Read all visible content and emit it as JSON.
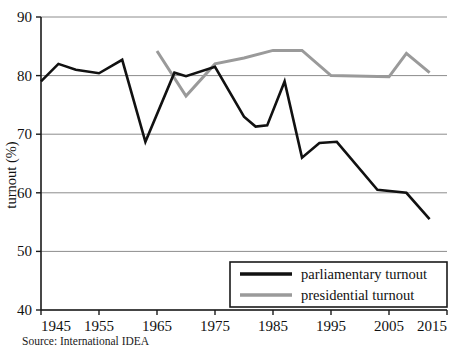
{
  "chart_data": {
    "type": "line",
    "title": "",
    "xlabel": "",
    "ylabel": "turnout (%)",
    "xlim": [
      1945,
      2015
    ],
    "ylim": [
      40,
      90
    ],
    "xticks": [
      1945,
      1955,
      1965,
      1975,
      1985,
      1995,
      2005,
      2015
    ],
    "yticks": [
      40,
      50,
      60,
      70,
      80,
      90
    ],
    "grid": true,
    "legend_position": "bottom-right",
    "source": "Source: International IDEA",
    "series": [
      {
        "name": "parliamentary turnout",
        "color": "#111111",
        "points": [
          [
            1945,
            79.0
          ],
          [
            1948,
            82.0
          ],
          [
            1951,
            81.0
          ],
          [
            1955,
            80.4
          ],
          [
            1959,
            82.7
          ],
          [
            1963,
            68.7
          ],
          [
            1968,
            80.5
          ],
          [
            1970,
            79.9
          ],
          [
            1975,
            81.5
          ],
          [
            1980,
            73.0
          ],
          [
            1982,
            71.3
          ],
          [
            1984,
            71.5
          ],
          [
            1987,
            79.0
          ],
          [
            1990,
            66.0
          ],
          [
            1993,
            68.5
          ],
          [
            1996,
            68.7
          ],
          [
            2003,
            60.5
          ],
          [
            2008,
            60.0
          ],
          [
            2012,
            55.5
          ]
        ]
      },
      {
        "name": "presidential turnout",
        "color": "#9a9a9a",
        "points": [
          [
            1965,
            84.2
          ],
          [
            1970,
            76.5
          ],
          [
            1975,
            82.0
          ],
          [
            1980,
            83.0
          ],
          [
            1985,
            84.3
          ],
          [
            1990,
            84.3
          ],
          [
            1995,
            80.0
          ],
          [
            2005,
            79.8
          ],
          [
            2008,
            83.8
          ],
          [
            2012,
            80.5
          ]
        ]
      }
    ]
  },
  "axis": {
    "y_title": "turnout (%)",
    "y_tick_labels": [
      "90",
      "80",
      "70",
      "60",
      "50",
      "40"
    ],
    "x_tick_labels": [
      "1945",
      "1955",
      "1965",
      "1975",
      "1985",
      "1995",
      "2005",
      "2015"
    ]
  },
  "legend": {
    "items": [
      {
        "label": "parliamentary turnout",
        "color": "#111111"
      },
      {
        "label": "presidential turnout",
        "color": "#9a9a9a"
      }
    ]
  },
  "footer": {
    "source": "Source: International IDEA"
  },
  "colors": {
    "parliamentary": "#111111",
    "presidential": "#9a9a9a",
    "grid": "#8c8c8c",
    "axis": "#1a1a1a",
    "background": "#ffffff"
  }
}
